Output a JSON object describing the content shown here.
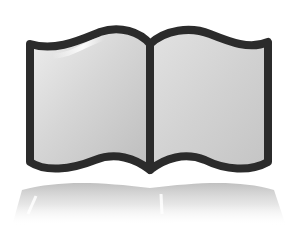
{
  "image": {
    "subject": "open-book-icon",
    "label": "Open book",
    "has_reflection": true
  },
  "colors": {
    "background": "#ffffff",
    "outline": "#2b2b2b",
    "page_light": "#e6e6e6",
    "page_mid": "#cfcfcf",
    "page_dark": "#b5b5b5",
    "highlight": "#ffffff",
    "reflection": "#c8c8c8"
  }
}
